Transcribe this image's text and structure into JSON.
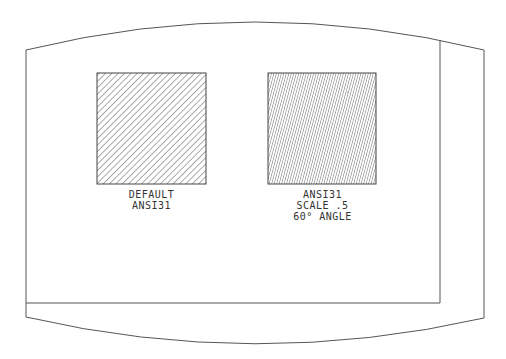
{
  "figure": {
    "colors": {
      "line": "#555555",
      "hatch": "#444444",
      "background": "#ffffff"
    },
    "panels": [
      {
        "id": "default",
        "pattern": "ANSI31",
        "hatch_angle_deg": 45,
        "hatch_spacing_px": 4.5,
        "labels": [
          "DEFAULT",
          "ANSI31"
        ]
      },
      {
        "id": "scaled",
        "pattern": "ANSI31",
        "hatch_angle_deg": 60,
        "hatch_spacing_px": 2.4,
        "labels": [
          "ANSI31",
          "SCALE .5",
          "60° ANGLE"
        ]
      }
    ]
  }
}
